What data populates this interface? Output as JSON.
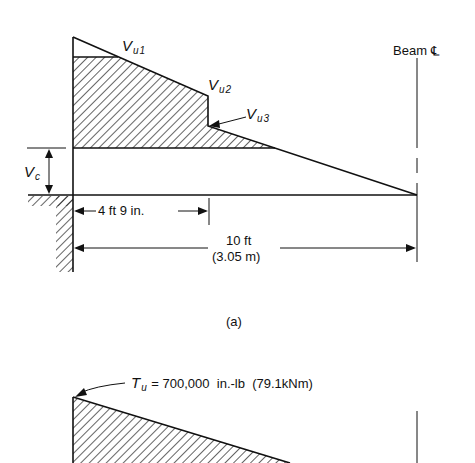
{
  "figure": {
    "panel_a": {
      "caption": "(a)",
      "labels": {
        "vu1_main": "V",
        "vu1_sub": "u1",
        "vu2_main": "V",
        "vu2_sub": "u2",
        "vu3_main": "V",
        "vu3_sub": "u3",
        "vc_main": "V",
        "vc_sub": "c",
        "beam_cl": "Beam",
        "cl_symbol": "℄",
        "dim_short": "4 ft 9 in.",
        "dim_long_ft": "10 ft",
        "dim_long_m": "(3.05 m)"
      }
    },
    "panel_b": {
      "torque_main": "T",
      "torque_sub": "u",
      "torque_value": "= 700,000  in.-lb  (79.1kNm)"
    },
    "colors": {
      "ink": "#111111",
      "background": "#ffffff"
    }
  }
}
